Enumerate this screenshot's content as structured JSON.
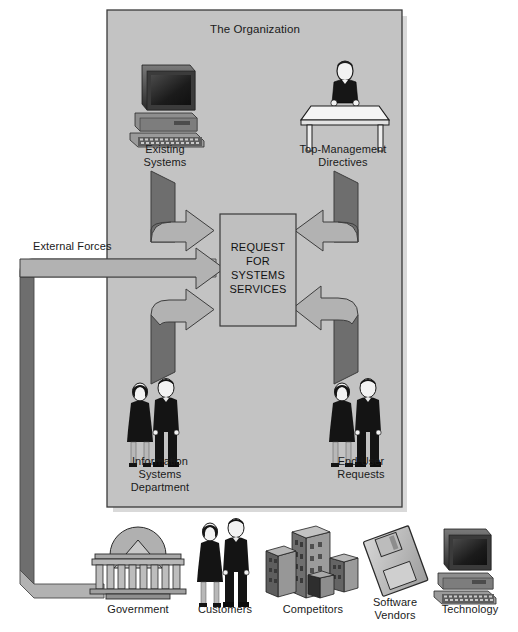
{
  "diagram": {
    "organization": {
      "title": "The Organization"
    },
    "center_box": {
      "text": "REQUEST\nFOR\nSYSTEMS\nSERVICES"
    },
    "external_forces": {
      "label": "External Forces"
    },
    "internal_sources": [
      {
        "id": "existing-systems",
        "label": "Existing\nSystems",
        "icon": "desktop-computer-icon"
      },
      {
        "id": "top-management-directives",
        "label": "Top-Management\nDirectives",
        "icon": "manager-at-desk-icon"
      },
      {
        "id": "information-systems-department",
        "label": "Information\nSystems\nDepartment",
        "icon": "two-people-icon"
      },
      {
        "id": "end-user-requests",
        "label": "End User\nRequests",
        "icon": "two-people-icon"
      }
    ],
    "external_sources": [
      {
        "id": "government",
        "label": "Government",
        "icon": "government-building-icon"
      },
      {
        "id": "customers",
        "label": "Customers",
        "icon": "two-people-icon"
      },
      {
        "id": "competitors",
        "label": "Competitors",
        "icon": "office-buildings-icon"
      },
      {
        "id": "software-vendors",
        "label": "Software\nVendors",
        "icon": "floppy-disk-icon"
      },
      {
        "id": "technology",
        "label": "Technology",
        "icon": "desktop-computer-icon"
      }
    ],
    "colors": {
      "organization_fill": "#c3c3c3",
      "organization_border": "#3a3a3a",
      "center_box_fill": "#bfbfbf",
      "ribbon_light": "#b2b2b2",
      "ribbon_dark": "#6e6e6e",
      "shadow": "#d9d9d9",
      "text": "#1a1a1a",
      "page_background": "#ffffff"
    }
  }
}
